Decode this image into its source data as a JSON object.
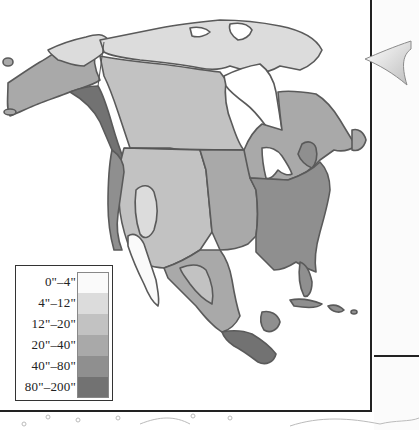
{
  "map": {
    "subject": "North America annual precipitation",
    "colors": {
      "outline": "#5a5a5a",
      "water": "#ffffff",
      "border_frame": "#222222"
    }
  },
  "legend": {
    "items": [
      {
        "label": "0\"–4\"",
        "color": "#fafafa"
      },
      {
        "label": "4\"–12\"",
        "color": "#dcdcdc"
      },
      {
        "label": "12\"–20\"",
        "color": "#c2c2c2"
      },
      {
        "label": "20\"–40\"",
        "color": "#a9a9a9"
      },
      {
        "label": "40\"–80\"",
        "color": "#8f8f8f"
      },
      {
        "label": "80\"–200\"",
        "color": "#727272"
      }
    ]
  },
  "decor": {
    "arrow": "left-pointing-arrow-icon"
  }
}
